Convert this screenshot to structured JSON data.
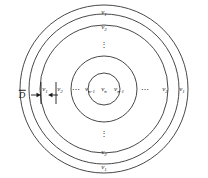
{
  "figure": {
    "name": "concentric-annuli-velocity-profile",
    "background": "#ffffff",
    "stroke_color": "#333333",
    "text_color": "#1a1a1a",
    "center": {
      "x": 104,
      "y": 89
    },
    "circles": [
      {
        "id": "ring-outer-1",
        "r": 84
      },
      {
        "id": "ring-outer-2",
        "r": 75
      },
      {
        "id": "ring-mid",
        "r": 64
      },
      {
        "id": "ring-inner-2",
        "r": 33
      },
      {
        "id": "ring-inner-1",
        "r": 16
      }
    ]
  },
  "labels": {
    "top": [
      {
        "name": "label-top-v1",
        "v": "v",
        "sub": "1",
        "x": 104,
        "y": 12
      },
      {
        "name": "label-top-v2",
        "v": "v",
        "sub": "2",
        "x": 104,
        "y": 27
      }
    ],
    "bottom": [
      {
        "name": "label-bottom-v2",
        "v": "v",
        "sub": "2",
        "x": 104,
        "y": 152
      },
      {
        "name": "label-bottom-v1",
        "v": "v",
        "sub": "1",
        "x": 104,
        "y": 167
      }
    ],
    "left": [
      {
        "name": "label-left-v1",
        "v": "v",
        "sub": "1",
        "x": 45,
        "y": 89
      },
      {
        "name": "label-left-v2",
        "v": "v",
        "sub": "2",
        "x": 60,
        "y": 89
      },
      {
        "name": "label-left-vn1",
        "v": "v",
        "sub": "n-1",
        "x": 90,
        "y": 89
      }
    ],
    "center": [
      {
        "name": "label-center-vn",
        "v": "v",
        "sub": "n",
        "x": 104,
        "y": 89
      }
    ],
    "right": [
      {
        "name": "label-right-vn1",
        "v": "v",
        "sub": "n-1",
        "x": 119,
        "y": 89
      },
      {
        "name": "label-right-v2",
        "v": "v",
        "sub": "2",
        "x": 165,
        "y": 89
      },
      {
        "name": "label-right-v1",
        "v": "v",
        "sub": "1",
        "x": 182,
        "y": 89
      }
    ]
  },
  "ellipses": {
    "horizontal": [
      {
        "name": "ellipsis-left",
        "glyph": "⋯",
        "x": 76,
        "y": 89
      },
      {
        "name": "ellipsis-right",
        "glyph": "⋯",
        "x": 145,
        "y": 89
      }
    ],
    "vertical": [
      {
        "name": "ellipsis-top",
        "glyph": "⋮",
        "x": 104,
        "y": 44
      },
      {
        "name": "ellipsis-bottom",
        "glyph": "⋮",
        "x": 104,
        "y": 133
      }
    ]
  },
  "annotation": {
    "name": "d-bar-dimension",
    "symbol": "D",
    "has_overbar": true,
    "label_x": 22,
    "label_y": 95,
    "arrow_right": {
      "x1": 31,
      "x2": 41,
      "y": 95
    },
    "arrow_left": {
      "x1": 58,
      "x2": 48,
      "y": 95
    },
    "tick_left": {
      "x": 41,
      "y1": 82,
      "y2": 104
    },
    "tick_right": {
      "x": 56,
      "y1": 82,
      "y2": 104
    }
  }
}
